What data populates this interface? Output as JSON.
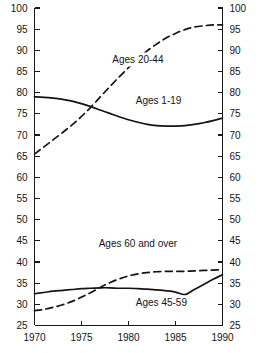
{
  "chart_data": {
    "type": "line",
    "title": "",
    "subtitle": "",
    "xlabel": "",
    "ylabel": "",
    "xlim": [
      1970,
      1990
    ],
    "ylim": [
      25,
      100
    ],
    "grid": false,
    "legend_position": "inline-annotations",
    "x_ticks": [
      "1970",
      "1975",
      "1980",
      "1985",
      "1990"
    ],
    "x_tick_values": [
      1970,
      1975,
      1980,
      1985,
      1990
    ],
    "y_ticks": [
      "25",
      "30",
      "35",
      "40",
      "45",
      "50",
      "55",
      "60",
      "65",
      "70",
      "75",
      "80",
      "85",
      "90",
      "95",
      "100"
    ],
    "y_tick_values": [
      25,
      30,
      35,
      40,
      45,
      50,
      55,
      60,
      65,
      70,
      75,
      80,
      85,
      90,
      95,
      100
    ],
    "y_axis_left": true,
    "y_axis_right": true,
    "series": [
      {
        "name": "Ages 1-19",
        "style": "solid",
        "label_x": 1983.2,
        "label_y": 77.4,
        "x": [
          1970,
          1971,
          1972,
          1973,
          1974,
          1975,
          1976,
          1977,
          1978,
          1979,
          1980,
          1981,
          1982,
          1983,
          1984,
          1985,
          1986,
          1987,
          1988,
          1989,
          1990
        ],
        "values": [
          79.0,
          78.9,
          78.7,
          78.4,
          78.0,
          77.4,
          76.7,
          75.9,
          75.1,
          74.3,
          73.6,
          73.0,
          72.5,
          72.2,
          72.1,
          72.1,
          72.2,
          72.5,
          72.9,
          73.4,
          74.0
        ]
      },
      {
        "name": "Ages 20-44",
        "style": "dashed",
        "label_x": 1981.0,
        "label_y": 87.0,
        "x": [
          1970,
          1971,
          1972,
          1973,
          1974,
          1975,
          1976,
          1977,
          1978,
          1979,
          1980,
          1981,
          1982,
          1983,
          1984,
          1985,
          1986,
          1987,
          1988,
          1989,
          1990
        ],
        "values": [
          65.5,
          67.2,
          68.9,
          70.6,
          72.4,
          74.4,
          76.6,
          79.0,
          81.4,
          83.7,
          85.9,
          88.0,
          89.9,
          91.5,
          92.9,
          94.0,
          94.9,
          95.5,
          95.8,
          96.0,
          96.0
        ]
      },
      {
        "name": "Ages 60 and over",
        "style": "dashed",
        "label_x": 1981.0,
        "label_y": 43.6,
        "x": [
          1970,
          1971,
          1972,
          1973,
          1974,
          1975,
          1976,
          1977,
          1978,
          1979,
          1980,
          1981,
          1982,
          1983,
          1984,
          1985,
          1986,
          1987,
          1988,
          1989,
          1990
        ],
        "values": [
          28.5,
          28.8,
          29.3,
          29.9,
          30.7,
          31.7,
          32.8,
          34.0,
          35.1,
          36.0,
          36.7,
          37.2,
          37.5,
          37.7,
          37.8,
          37.8,
          37.8,
          37.9,
          38.0,
          38.1,
          38.2
        ]
      },
      {
        "name": "Ages 45-59",
        "style": "solid",
        "label_x": 1983.5,
        "label_y": 29.6,
        "x": [
          1970,
          1971,
          1972,
          1973,
          1974,
          1975,
          1976,
          1977,
          1978,
          1979,
          1980,
          1981,
          1982,
          1983,
          1984,
          1985,
          1986,
          1987,
          1988,
          1989,
          1990
        ],
        "values": [
          32.5,
          32.8,
          33.1,
          33.3,
          33.5,
          33.7,
          33.8,
          33.9,
          33.9,
          33.8,
          33.8,
          33.7,
          33.6,
          33.4,
          33.2,
          32.9,
          32.3,
          33.5,
          34.7,
          35.9,
          37.0
        ]
      }
    ]
  }
}
